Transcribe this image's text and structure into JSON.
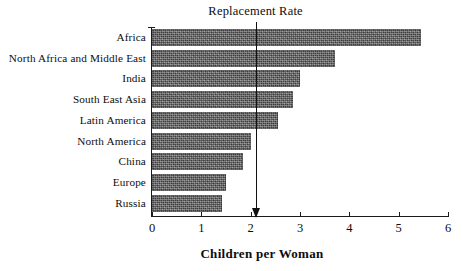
{
  "chart_data": {
    "type": "bar",
    "orientation": "horizontal",
    "title": "",
    "xlabel": "Children per Woman",
    "ylabel": "",
    "xlim": [
      0,
      6
    ],
    "xticks": [
      "0",
      "1",
      "2",
      "3",
      "4",
      "5",
      "6"
    ],
    "grid": false,
    "legend": null,
    "categories": [
      "Africa",
      "North Africa and Middle East",
      "India",
      "South East Asia",
      "Latin America",
      "North America",
      "China",
      "Europe",
      "Russia"
    ],
    "values": [
      5.45,
      3.7,
      3.0,
      2.85,
      2.55,
      2.0,
      1.85,
      1.5,
      1.42
    ],
    "annotations": [
      {
        "label": "Replacement Rate",
        "value": 2.1,
        "type": "vertical-arrow"
      }
    ],
    "bar_color": "#5d5d5d"
  }
}
